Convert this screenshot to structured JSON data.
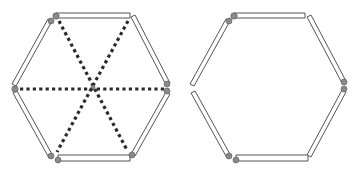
{
  "diagram": {
    "figures": [
      {
        "id": "left-hexagon",
        "label": "",
        "sticks": 6,
        "joints": 6,
        "dotted_diagonals": 3,
        "note": "Three dotted lines connect opposite vertices through the center"
      },
      {
        "id": "right-hexagon",
        "label": "",
        "sticks": 6,
        "joints": 4,
        "dotted_diagonals": 0,
        "note": "Left vertex joint is open (sticks separated); bottom-right stick end is loose"
      }
    ],
    "colors": {
      "stick_outline": "#555555",
      "stick_fill": "#ffffff",
      "joint": "#8a8a8a",
      "diagonal": "#2a2a2a"
    }
  }
}
